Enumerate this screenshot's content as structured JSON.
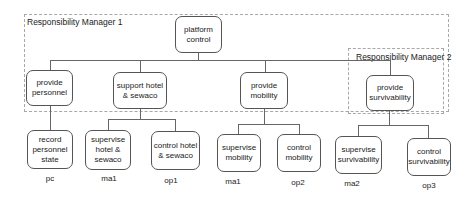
{
  "managers": [
    {
      "id": "rm1",
      "label": "Responsibility Manager 1"
    },
    {
      "id": "rm2",
      "label": "Responsibility Manager 2"
    }
  ],
  "root": {
    "label": "platform control"
  },
  "level1": [
    {
      "label": "provide personnel"
    },
    {
      "label": "support hotel & sewaco"
    },
    {
      "label": "provide mobility"
    },
    {
      "label": "provide survivability"
    }
  ],
  "level2": [
    {
      "label": "record personnel state",
      "tag": "pc"
    },
    {
      "label": "supervise hotel & sewaco",
      "tag": "ma1"
    },
    {
      "label": "control hotel & sewaco",
      "tag": "op1"
    },
    {
      "label": "supervise mobility",
      "tag": "ma1"
    },
    {
      "label": "control mobility",
      "tag": "op2"
    },
    {
      "label": "supervise survivability",
      "tag": "ma2"
    },
    {
      "label": "control survivability",
      "tag": "op3"
    }
  ]
}
